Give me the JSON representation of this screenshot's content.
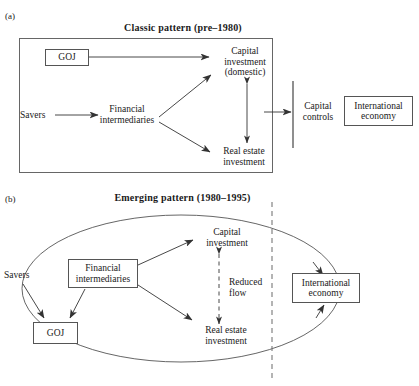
{
  "figure": {
    "width": 419,
    "height": 386,
    "background": "#ffffff",
    "line_color": "#555555",
    "text_color": "#1a1a1a"
  },
  "panel_a": {
    "label": "(a)",
    "title": "Classic pattern (pre–1980)",
    "nodes": {
      "goj": "GOJ",
      "savers": "Savers",
      "financial_intermediaries": "Financial\nintermediaries",
      "capital_investment": "Capital\ninvestment\n(domestic)",
      "real_estate_investment": "Real estate\ninvestment",
      "capital_controls": "Capital\ncontrols",
      "international_economy": "International\neconomy"
    },
    "edges": [
      {
        "from": "goj",
        "to": "capital_investment",
        "style": "solid",
        "arrows": "one-way"
      },
      {
        "from": "savers",
        "to": "financial_intermediaries",
        "style": "solid",
        "arrows": "one-way"
      },
      {
        "from": "financial_intermediaries",
        "to": "capital_investment",
        "style": "solid",
        "arrows": "one-way"
      },
      {
        "from": "financial_intermediaries",
        "to": "real_estate_investment",
        "style": "solid",
        "arrows": "one-way"
      },
      {
        "from": "capital_investment",
        "to": "real_estate_investment",
        "style": "solid",
        "arrows": "two-way"
      },
      {
        "from": "domestic_box",
        "to": "capital_controls",
        "style": "solid",
        "arrows": "one-way"
      }
    ]
  },
  "panel_b": {
    "label": "(b)",
    "title": "Emerging pattern (1980–1995)",
    "nodes": {
      "goj": "GOJ",
      "savers": "Savers",
      "financial_intermediaries": "Financial\nintermediaries",
      "capital_investment": "Capital\ninvestment",
      "real_estate_investment": "Real estate\ninvestment",
      "international_economy": "International\neconomy",
      "reduced_flow": "Reduced\nflow"
    },
    "edges": [
      {
        "from": "savers",
        "to": "goj",
        "style": "solid",
        "arrows": "one-way"
      },
      {
        "from": "financial_intermediaries",
        "to": "goj",
        "style": "solid",
        "arrows": "one-way"
      },
      {
        "from": "financial_intermediaries",
        "to": "capital_investment",
        "style": "solid",
        "arrows": "one-way"
      },
      {
        "from": "financial_intermediaries",
        "to": "real_estate_investment",
        "style": "solid",
        "arrows": "one-way"
      },
      {
        "from": "capital_investment",
        "to": "real_estate_investment",
        "style": "dashed",
        "arrows": "two-way",
        "label": "Reduced flow"
      },
      {
        "from": "savers_loop",
        "to": "international_economy",
        "style": "solid-curve",
        "arrows": "one-way"
      },
      {
        "from": "financial_intermediaries_loop",
        "to": "international_economy",
        "style": "solid-curve",
        "arrows": "one-way"
      }
    ],
    "border_line": {
      "style": "dashed",
      "orientation": "vertical",
      "meaning": "national border"
    }
  }
}
